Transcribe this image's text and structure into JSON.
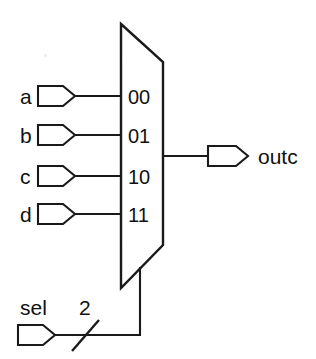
{
  "diagram": {
    "background_color": "#ffffff",
    "line_color": "#1a1a1a",
    "mux": {
      "name": "mux-body",
      "select_codes": [
        {
          "code": "00",
          "input": "a"
        },
        {
          "code": "01",
          "input": "b"
        },
        {
          "code": "10",
          "input": "c"
        },
        {
          "code": "11",
          "input": "d"
        }
      ]
    },
    "inputs": [
      {
        "label": "a",
        "code": "00"
      },
      {
        "label": "b",
        "code": "01"
      },
      {
        "label": "c",
        "code": "10"
      },
      {
        "label": "d",
        "code": "11"
      }
    ],
    "output": {
      "label": "outc"
    },
    "select": {
      "label": "sel",
      "bus_width": "2"
    }
  }
}
